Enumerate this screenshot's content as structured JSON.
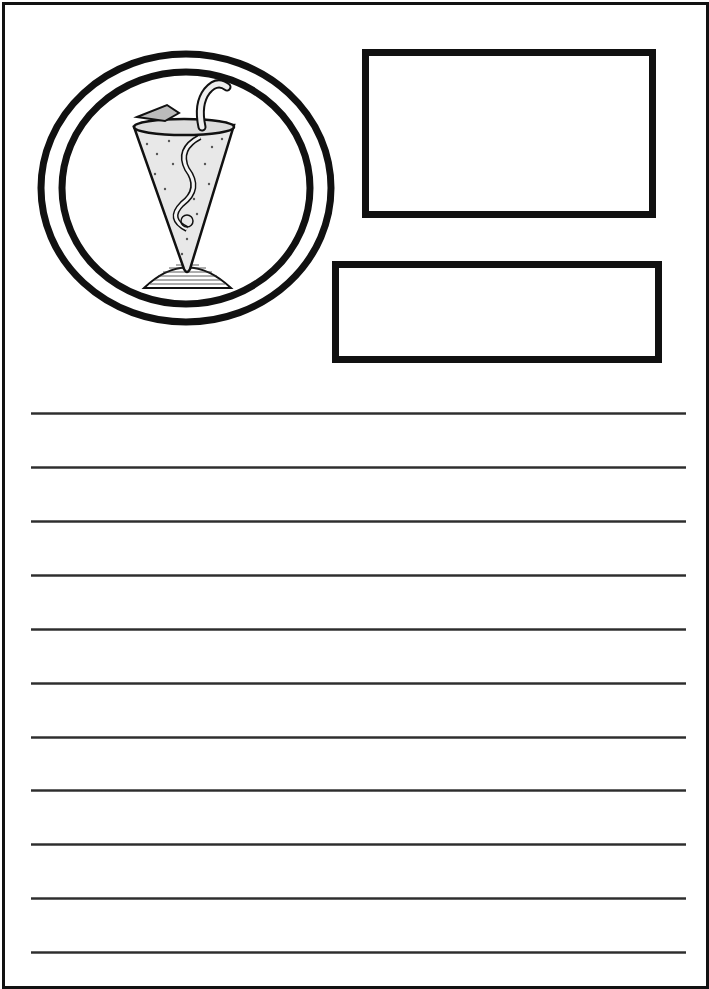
{
  "document": {
    "type": "lined writing page",
    "background_color": "#ffffff",
    "ink_color": "#111111"
  },
  "emblem": {
    "icon": "goblet-with-serpent-icon",
    "rings": 2
  },
  "boxes": [
    {
      "name": "title-box",
      "value": ""
    },
    {
      "name": "subtitle-box",
      "value": ""
    }
  ],
  "writing_lines": {
    "count": 11,
    "y_positions": [
      413,
      467,
      521,
      575,
      629,
      683,
      737,
      790,
      844,
      898,
      952
    ],
    "values": [
      "",
      "",
      "",
      "",
      "",
      "",
      "",
      "",
      "",
      "",
      ""
    ]
  }
}
